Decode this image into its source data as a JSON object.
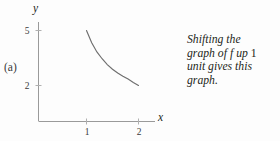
{
  "figure": {
    "panel_label": "(a)",
    "axis_label_x": "x",
    "axis_label_y": "y",
    "x_ticks": [
      "1",
      "2"
    ],
    "y_ticks": [
      "5",
      "2"
    ],
    "axis_color": "#8a8a8a",
    "curve_color": "#6b6b6b",
    "text_color": "#231f20"
  },
  "caption": {
    "line1": "Shifting the",
    "line2a": "graph of",
    "line2b": "f",
    "line2c": "up",
    "line2d": "1",
    "line3": "unit gives this",
    "line4": "graph."
  },
  "chart_data": {
    "type": "line",
    "title": "",
    "xlabel": "x",
    "ylabel": "y",
    "xlim": [
      0,
      2.35
    ],
    "ylim": [
      0,
      5.6
    ],
    "xticks": [
      1,
      2
    ],
    "yticks": [
      2,
      5
    ],
    "grid": false,
    "legend": false,
    "series": [
      {
        "name": "shifted graph of f",
        "x": [
          1.0,
          1.1,
          1.2,
          1.3,
          1.4,
          1.5,
          1.6,
          1.7,
          1.8,
          1.9,
          2.0
        ],
        "y": [
          5.0,
          4.33,
          3.83,
          3.46,
          3.14,
          2.89,
          2.68,
          2.5,
          2.35,
          2.16,
          2.0
        ]
      }
    ]
  }
}
